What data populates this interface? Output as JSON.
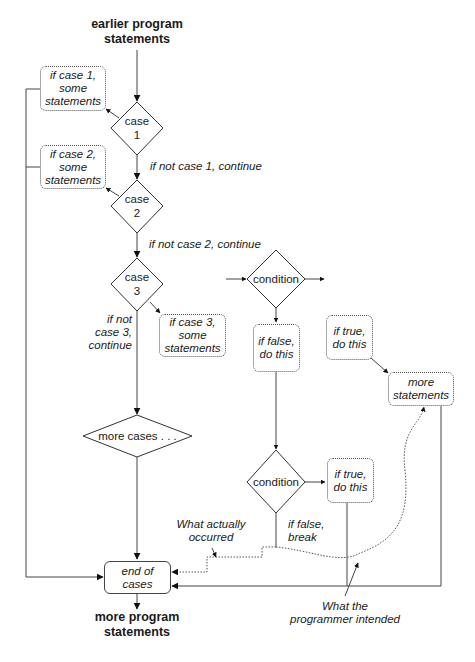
{
  "start": {
    "line1": "earlier program",
    "line2": "statements"
  },
  "end": {
    "line1": "more program",
    "line2": "statements"
  },
  "decisions": {
    "case1": {
      "line1": "case",
      "line2": "1"
    },
    "case2": {
      "line1": "case",
      "line2": "2"
    },
    "case3": {
      "line1": "case",
      "line2": "3"
    },
    "condition1": "condition",
    "more_cases": "more cases . . .",
    "condition2": "condition"
  },
  "boxes": {
    "case1_statements": {
      "line1": "if case 1,",
      "line2": "some",
      "line3": "statements"
    },
    "case2_statements": {
      "line1": "if case 2,",
      "line2": "some",
      "line3": "statements"
    },
    "case3_statements": {
      "line1": "if case 3,",
      "line2": "some",
      "line3": "statements"
    },
    "if_true_1": {
      "line1": "if true,",
      "line2": "do this"
    },
    "more_statements": {
      "line1": "more",
      "line2": "statements"
    },
    "if_false_1": {
      "line1": "if false,",
      "line2": "do this"
    },
    "if_true_2": {
      "line1": "if true,",
      "line2": "do this"
    },
    "end_of_cases": {
      "line1": "end of",
      "line2": "cases"
    }
  },
  "edge_labels": {
    "not_case1": "if not case 1, continue",
    "not_case2": "if not case 2, continue",
    "not_case3": {
      "line1": "if not",
      "line2": "case 3,",
      "line3": "continue"
    },
    "false_break": {
      "line1": "if false,",
      "line2": "break"
    }
  },
  "annotations": {
    "actual": {
      "line1": "What actually",
      "line2": "occurred"
    },
    "intended": {
      "line1": "What the",
      "line2": "programmer intended"
    }
  }
}
